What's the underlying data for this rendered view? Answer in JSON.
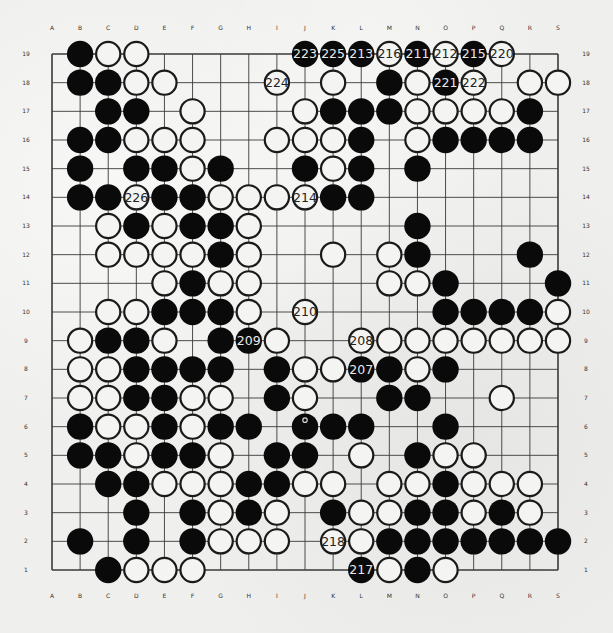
{
  "board": {
    "size": 19,
    "columns": [
      "A",
      "B",
      "C",
      "D",
      "E",
      "F",
      "G",
      "H",
      "I",
      "J",
      "K",
      "L",
      "M",
      "N",
      "O",
      "P",
      "Q",
      "R",
      "S"
    ],
    "rows": [
      "19",
      "18",
      "17",
      "16",
      "15",
      "14",
      "13",
      "12",
      "11",
      "10",
      "9",
      "8",
      "7",
      "6",
      "5",
      "4",
      "3",
      "2",
      "1"
    ],
    "colors": {
      "black": "#0a0a0a",
      "white": "#f4f4f2",
      "line": "#3a3a3a",
      "stone_outline": "#1a1a1a"
    },
    "last_move_marker": "J6",
    "stones": {
      "19": {
        "B": "b",
        "C": "w",
        "D": "w",
        "J": "b:223",
        "K": "b:225",
        "L": "b:213",
        "M": "w:216",
        "N": "b:211",
        "O": "w:212",
        "P": "b:215",
        "Q": "w:220"
      },
      "18": {
        "B": "b",
        "C": "b",
        "D": "w",
        "E": "w",
        "I": "w:224",
        "K": "w",
        "M": "b",
        "N": "w",
        "O": "b:221",
        "P": "w:222",
        "R": "w",
        "S": "w"
      },
      "17": {
        "C": "b",
        "D": "b",
        "F": "w",
        "J": "w",
        "K": "b",
        "L": "b",
        "M": "b",
        "N": "w",
        "O": "w",
        "P": "w",
        "Q": "w",
        "R": "b"
      },
      "16": {
        "B": "b",
        "C": "b",
        "D": "w",
        "E": "w",
        "F": "w",
        "I": "w",
        "J": "w",
        "K": "w",
        "L": "b",
        "N": "w",
        "O": "b",
        "P": "b",
        "Q": "b",
        "R": "b"
      },
      "15": {
        "B": "b",
        "D": "b",
        "E": "b",
        "F": "w",
        "G": "b",
        "J": "b",
        "K": "w",
        "L": "b",
        "N": "b"
      },
      "14": {
        "B": "b",
        "C": "b",
        "D": "w:226",
        "E": "b",
        "F": "b",
        "G": "w",
        "H": "w",
        "I": "w",
        "J": "w:214",
        "K": "b",
        "L": "b"
      },
      "13": {
        "C": "w",
        "D": "b",
        "E": "w",
        "F": "b",
        "G": "b",
        "H": "w",
        "N": "b"
      },
      "12": {
        "C": "w",
        "D": "w",
        "E": "w",
        "F": "w",
        "G": "b",
        "H": "w",
        "K": "w",
        "M": "w",
        "N": "b",
        "R": "b"
      },
      "11": {
        "E": "w",
        "F": "b",
        "G": "w",
        "H": "w",
        "M": "w",
        "N": "w",
        "O": "b",
        "S": "b"
      },
      "10": {
        "C": "w",
        "D": "w",
        "E": "b",
        "F": "b",
        "G": "b",
        "H": "w",
        "J": "w:210",
        "O": "b",
        "P": "b",
        "Q": "b",
        "R": "b",
        "S": "w"
      },
      "9": {
        "B": "w",
        "C": "b",
        "D": "b",
        "E": "w",
        "G": "b",
        "H": "b:209",
        "I": "w",
        "L": "w:208",
        "M": "w",
        "N": "w",
        "O": "w",
        "P": "w",
        "Q": "w",
        "R": "w",
        "S": "w"
      },
      "8": {
        "B": "w",
        "C": "w",
        "D": "b",
        "E": "b",
        "F": "b",
        "G": "b",
        "I": "b",
        "J": "w",
        "K": "w",
        "L": "b:207",
        "M": "b",
        "N": "w",
        "O": "b"
      },
      "7": {
        "B": "w",
        "C": "w",
        "D": "b",
        "E": "b",
        "F": "w",
        "G": "w",
        "I": "b",
        "J": "w",
        "M": "b",
        "N": "b",
        "Q": "w"
      },
      "6": {
        "B": "b",
        "C": "w",
        "D": "w",
        "E": "b",
        "F": "w",
        "G": "b",
        "H": "b",
        "J": "b",
        "K": "b",
        "L": "b",
        "O": "b"
      },
      "5": {
        "B": "b",
        "C": "b",
        "D": "w",
        "E": "b",
        "F": "b",
        "G": "w",
        "I": "b",
        "J": "b",
        "L": "w",
        "N": "b",
        "O": "w",
        "P": "w"
      },
      "4": {
        "C": "b",
        "D": "b",
        "E": "w",
        "F": "w",
        "G": "w",
        "H": "b",
        "I": "b",
        "J": "w",
        "K": "w",
        "M": "w",
        "N": "w",
        "O": "b",
        "P": "w",
        "Q": "w",
        "R": "w"
      },
      "3": {
        "D": "b",
        "F": "b",
        "G": "w",
        "H": "b",
        "I": "w",
        "K": "b",
        "L": "w",
        "M": "w",
        "N": "b",
        "O": "b",
        "P": "w",
        "Q": "b",
        "R": "w"
      },
      "2": {
        "B": "b",
        "D": "b",
        "F": "b",
        "G": "w",
        "H": "w",
        "I": "w",
        "K": "w:218",
        "L": "w",
        "M": "b",
        "N": "b",
        "O": "b",
        "P": "b",
        "Q": "b",
        "R": "b",
        "S": "b"
      },
      "1": {
        "C": "b",
        "D": "w",
        "E": "w",
        "F": "w",
        "L": "b:217",
        "M": "w",
        "N": "b",
        "O": "w"
      }
    }
  }
}
